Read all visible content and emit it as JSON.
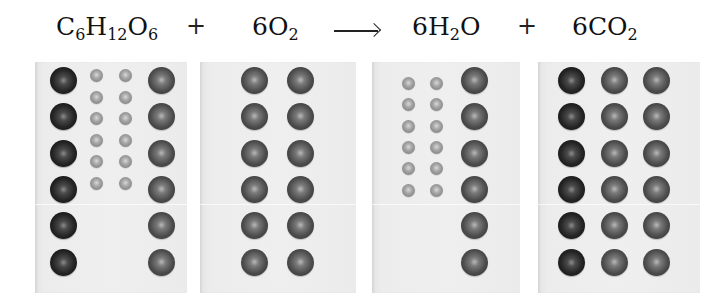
{
  "equation": {
    "reactants": [
      {
        "label": "C6H12O6",
        "parts": [
          "C",
          "6",
          "H",
          "12",
          "O",
          "6"
        ]
      },
      {
        "label": "6O2",
        "parts": [
          "6O",
          "2"
        ]
      }
    ],
    "products": [
      {
        "label": "6H2O",
        "parts": [
          "6H",
          "2",
          "O"
        ]
      },
      {
        "label": "6CO2",
        "parts": [
          "6CO",
          "2"
        ]
      }
    ],
    "plus_symbol": "+",
    "arrow_symbol": "→"
  },
  "panels": [
    {
      "name": "glucose",
      "formula": "C6H12O6",
      "atoms": {
        "carbon": 6,
        "hydrogen": 12,
        "oxygen": 6
      }
    },
    {
      "name": "oxygen-gas",
      "formula": "6O2",
      "atoms": {
        "oxygen": 12
      }
    },
    {
      "name": "water",
      "formula": "6H2O",
      "atoms": {
        "hydrogen": 12,
        "oxygen": 6
      }
    },
    {
      "name": "carbon-dioxide",
      "formula": "6CO2",
      "atoms": {
        "carbon": 6,
        "oxygen": 12
      }
    }
  ],
  "colors": {
    "carbon": "#1a1a1a",
    "oxygen": "#454545",
    "hydrogen": "#9a9a9a",
    "panel_background": "#ececec"
  }
}
